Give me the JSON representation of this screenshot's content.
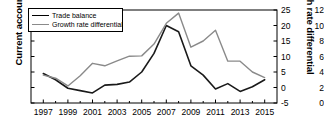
{
  "chart_data": {
    "type": "line",
    "title": "",
    "xlabel": "",
    "ylabel": "Current account",
    "y2label": "Growth rate differential",
    "grid": false,
    "legend_position": "top-left",
    "x": [
      1996,
      1997,
      1998,
      1999,
      2000,
      2001,
      2002,
      2003,
      2004,
      2005,
      2006,
      2007,
      2008,
      2009,
      2010,
      2011,
      2012,
      2013,
      2014,
      2015
    ],
    "xlim": [
      1996,
      2016
    ],
    "xticks": [
      1997,
      1999,
      2001,
      2003,
      2005,
      2007,
      2009,
      2011,
      2013,
      2015
    ],
    "xticklabels": [
      "1997",
      "1999",
      "2001",
      "2003",
      "2005",
      "2007",
      "2009",
      "2011",
      "2013",
      "2015"
    ],
    "xminorticks": [
      1998,
      2000,
      2002,
      2004,
      2006,
      2008,
      2010,
      2012,
      2014
    ],
    "ylim": [
      0,
      12
    ],
    "yticks": [
      0,
      2,
      4,
      6,
      8,
      10,
      12
    ],
    "yticklabels": [
      "0",
      "2",
      "4",
      "6",
      "8",
      "10",
      "12"
    ],
    "y2lim": [
      -5,
      25
    ],
    "y2ticks": [
      -5,
      0,
      5,
      10,
      15,
      20,
      25
    ],
    "y2ticklabels": [
      "-5",
      "0",
      "5",
      "10",
      "15",
      "20",
      "25"
    ],
    "series": [
      {
        "name": "Trade balance",
        "axis": "left",
        "color": "#1a1a1a",
        "width": 1.6,
        "x": [
          1997,
          1998,
          1999,
          2000,
          2001,
          2002,
          2003,
          2004,
          2005,
          2006,
          2007,
          2008,
          2009,
          2010,
          2011,
          2012,
          2013,
          2014,
          2015
        ],
        "values": [
          3.8,
          3.0,
          1.9,
          1.6,
          1.3,
          2.3,
          2.4,
          2.7,
          4.0,
          6.4,
          10.0,
          9.2,
          4.8,
          3.6,
          1.8,
          2.5,
          1.5,
          2.1,
          3.0
        ]
      },
      {
        "name": "Growth rate differential",
        "axis": "right",
        "color": "#8a8a8a",
        "width": 1.4,
        "x": [
          1997,
          1998,
          1999,
          2000,
          2001,
          2002,
          2003,
          2004,
          2005,
          2006,
          2007,
          2008,
          2009,
          2010,
          2011,
          2012,
          2013,
          2014,
          2015
        ],
        "values": [
          4.0,
          3.0,
          0.5,
          3.8,
          7.8,
          7.0,
          8.6,
          10.1,
          10.2,
          14.0,
          20.7,
          24.0,
          13.0,
          15.0,
          18.5,
          8.5,
          8.5,
          5.0,
          3.2
        ]
      }
    ]
  },
  "legend": {
    "items": [
      {
        "label": "Trade balance"
      },
      {
        "label": "Growth rate differential"
      }
    ]
  },
  "colors": {
    "trade_balance": "#1a1a1a",
    "growth_rate_differential": "#8a8a8a",
    "axis": "#000000",
    "background": "#ffffff"
  }
}
